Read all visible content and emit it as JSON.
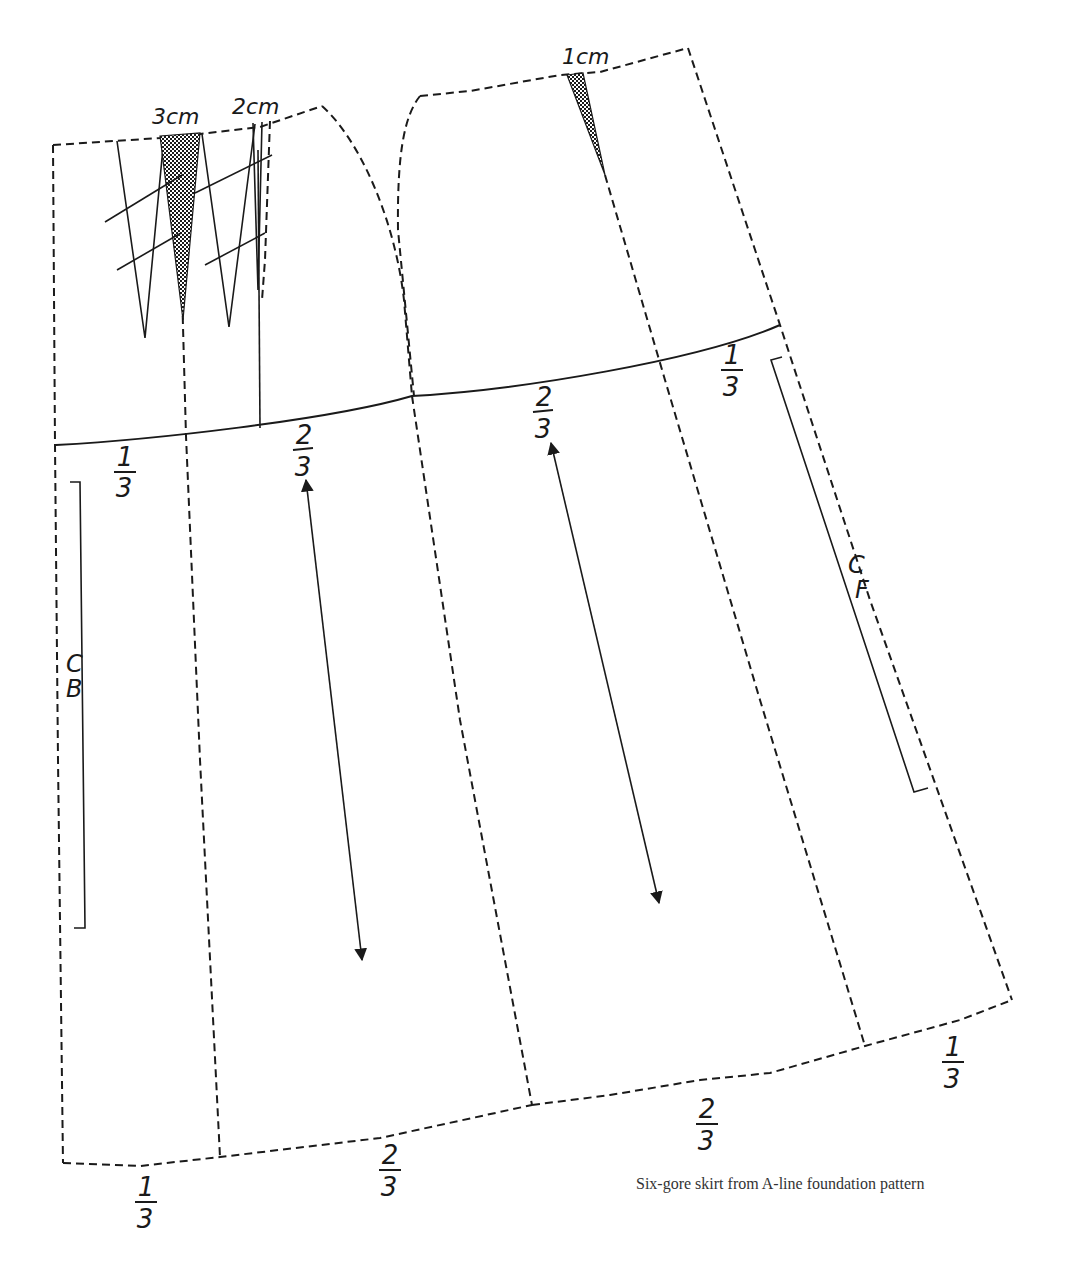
{
  "figure": {
    "caption": "Six-gore skirt from A-line foundation pattern",
    "ink_color": "#1a1a1a",
    "background": "#ffffff"
  },
  "labels": {
    "dart_back_large": "3cm",
    "dart_back_small": "2cm",
    "dart_front": "1cm",
    "center_back_c": "C",
    "center_back_b": "B",
    "center_front_c": "C",
    "center_front_f": "F"
  },
  "fractions": {
    "hip_back_left": {
      "num": "1",
      "den": "3"
    },
    "hip_back_mid": {
      "num": "2",
      "den": "3"
    },
    "hip_front_mid": {
      "num": "2",
      "den": "3"
    },
    "hip_front_right": {
      "num": "1",
      "den": "3"
    },
    "hem_back_left": {
      "num": "1",
      "den": "3"
    },
    "hem_back_mid": {
      "num": "2",
      "den": "3"
    },
    "hem_front_mid": {
      "num": "2",
      "den": "3"
    },
    "hem_front_right": {
      "num": "1",
      "den": "3"
    }
  },
  "annotations": {
    "grainlines": 2,
    "pattern_pieces": [
      "back side gore",
      "back center gore",
      "front center gore",
      "front side gore"
    ]
  }
}
